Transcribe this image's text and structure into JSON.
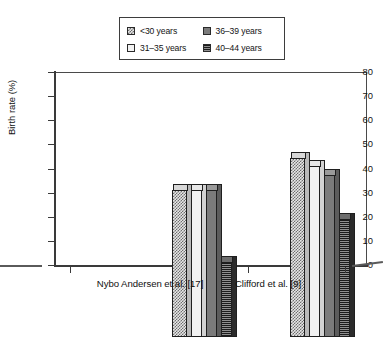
{
  "chart_data": {
    "type": "bar",
    "title": "",
    "subtitle": "",
    "xlabel": "",
    "ylabel": "Birth rate (%)",
    "ylim": [
      0,
      80
    ],
    "yticks": [
      0,
      10,
      20,
      30,
      40,
      50,
      60,
      70,
      80
    ],
    "ytick_labels": [
      "0",
      "10",
      "20",
      "30",
      "40",
      "50",
      "60",
      "70",
      "80"
    ],
    "grid": false,
    "legend_position": "top-center",
    "categories": [
      "Nybo Andersen et al. [17]",
      "Clifford et al. [9]"
    ],
    "series": [
      {
        "name": "<30 years",
        "pattern": "crosshatch",
        "values": [
          61,
          74
        ]
      },
      {
        "name": "31–35 years",
        "pattern": "blank",
        "values": [
          61,
          71
        ]
      },
      {
        "name": "36–39 years",
        "pattern": "solid-gray",
        "values": [
          61,
          67
        ]
      },
      {
        "name": "40–44 years",
        "pattern": "horizontal-lines",
        "values": [
          31,
          49
        ]
      }
    ]
  },
  "legend": {
    "entries": [
      {
        "label": "<30 years",
        "swatch": "crosshatch-swatch"
      },
      {
        "label": "36–39 years",
        "swatch": "solid-gray-swatch"
      },
      {
        "label": "31–35 years",
        "swatch": "blank-swatch"
      },
      {
        "label": "40–44 years",
        "swatch": "horizontal-lines-swatch"
      }
    ]
  },
  "axes": {
    "y_title": "Birth rate (%)",
    "y_labels": [
      "80",
      "70",
      "60",
      "50",
      "40",
      "30",
      "20",
      "10",
      "0"
    ],
    "x_labels": [
      "Nybo Andersen et al. [17]",
      "Clifford et al. [9]"
    ]
  },
  "colors": {
    "axis": "#3a3a3a",
    "frame": "#4a4a4a",
    "text": "#111111",
    "bar_outline": "#1f1f1f",
    "solid_gray": "#7b7b7b",
    "dark_stripe": "#2b2b2b",
    "background": "#ffffff"
  }
}
